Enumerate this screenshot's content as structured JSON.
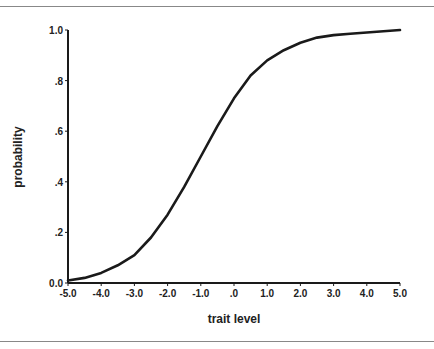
{
  "chart_data": {
    "type": "line",
    "title": "",
    "xlabel": "trait level",
    "ylabel": "probability",
    "xlim": [
      -5.0,
      5.0
    ],
    "ylim": [
      0.0,
      1.0
    ],
    "grid": false,
    "legend": null,
    "x_ticks": [
      "-5.0",
      "-4.0",
      "-3.0",
      "-2.0",
      "-1.0",
      ".0",
      "1.0",
      "2.0",
      "3.0",
      "4.0",
      "5.0"
    ],
    "y_ticks": [
      "0.0",
      ".2",
      ".4",
      ".6",
      ".8",
      "1.0"
    ],
    "x": [
      -5.0,
      -4.5,
      -4.0,
      -3.5,
      -3.0,
      -2.5,
      -2.0,
      -1.5,
      -1.0,
      -0.5,
      0.0,
      0.5,
      1.0,
      1.5,
      2.0,
      2.5,
      3.0,
      3.5,
      4.0,
      4.5,
      5.0
    ],
    "series": [
      {
        "name": "item characteristic curve",
        "values": [
          0.01,
          0.02,
          0.04,
          0.07,
          0.11,
          0.18,
          0.27,
          0.38,
          0.5,
          0.62,
          0.73,
          0.82,
          0.88,
          0.92,
          0.95,
          0.97,
          0.98,
          0.985,
          0.99,
          0.995,
          1.0
        ]
      }
    ]
  }
}
